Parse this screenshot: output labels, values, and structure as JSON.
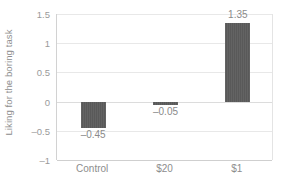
{
  "chart_data": {
    "type": "bar",
    "title": "",
    "subtitle": "",
    "xlabel": "",
    "ylabel": "Liking for the boring task",
    "categories": [
      "Control",
      "$20",
      "$1"
    ],
    "values": [
      -0.45,
      -0.05,
      1.35
    ],
    "value_labels": [
      "–0.45",
      "–0.05",
      "1.35"
    ],
    "ylim": [
      -1,
      1.5
    ],
    "y_ticks": [
      1.5,
      1,
      0.5,
      0,
      -0.5,
      -1
    ],
    "y_tick_labels": [
      "1.5",
      "1",
      "0.5",
      "0",
      "–0.5",
      "–1"
    ],
    "grid": true,
    "legend": false,
    "legend_position": "none",
    "series": [
      {
        "name": "Liking for the boring task",
        "values": [
          -0.45,
          -0.05,
          1.35
        ]
      }
    ],
    "colors": {
      "bar_fill": "#595959",
      "gridline": "#e8e8e8",
      "axis_line": "#cfcfcf",
      "text": "#8a8a8a",
      "background": "#ffffff"
    }
  }
}
